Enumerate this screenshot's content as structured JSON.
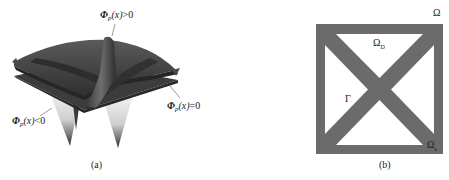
{
  "figure": {
    "panel_a": {
      "caption": "(a)",
      "description": "3D level-set surface with X-shaped ridge over flat plane, two downward cusps",
      "labels": {
        "positive": {
          "phi": "Φ",
          "sub": "p",
          "arg": "(x)",
          "rel": ">0"
        },
        "zero": {
          "phi": "Φ",
          "sub": "p",
          "arg": "(x)",
          "rel": "=0"
        },
        "negative": {
          "phi": "Φ",
          "sub": "p",
          "arg": "(x)",
          "rel": "<0"
        }
      }
    },
    "panel_b": {
      "caption": "(b)",
      "description": "Square domain with dark border and X-shaped diagonal bars",
      "labels": {
        "omega": "Ω",
        "omega_d": {
          "base": "Ω",
          "sub": "D"
        },
        "gamma": "Γ",
        "omega_s": {
          "base": "Ω",
          "sub": "s"
        }
      },
      "colors": {
        "material": "#6b6b6b",
        "void": "#ffffff"
      }
    }
  }
}
